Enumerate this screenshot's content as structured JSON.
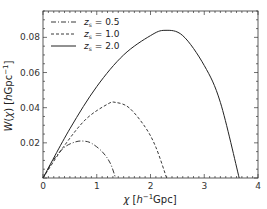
{
  "chart_data": {
    "type": "line",
    "title": "",
    "xlabel": "χ [h⁻¹Gpc]",
    "ylabel": "W(χ) [hGpc⁻¹]",
    "xlim": [
      0,
      4
    ],
    "ylim": [
      0,
      0.095
    ],
    "xticks": [
      0,
      1,
      2,
      3,
      4
    ],
    "xtick_labels": [
      "0",
      "1",
      "2",
      "3",
      "4"
    ],
    "yticks": [
      0.02,
      0.04,
      0.06,
      0.08
    ],
    "ytick_labels": [
      "0.02",
      "0.04",
      "0.06",
      "0.08"
    ],
    "grid": false,
    "legend_position": "upper left",
    "series": [
      {
        "name": "z_s = 0.5",
        "label_main": "z",
        "label_sub": "s",
        "label_val": " = 0.5",
        "style": "dashdot",
        "chi_s": 1.35,
        "x": [
          0,
          0.2,
          0.4,
          0.6,
          0.75,
          0.9,
          1.1,
          1.25,
          1.35
        ],
        "values": [
          0,
          0.0105,
          0.0175,
          0.0205,
          0.021,
          0.0198,
          0.015,
          0.0085,
          0
        ]
      },
      {
        "name": "z_s = 1.0",
        "label_main": "z",
        "label_sub": "s",
        "label_val": " = 1.0",
        "style": "dashed",
        "chi_s": 2.3,
        "x": [
          0,
          0.4,
          0.8,
          1.2,
          1.35,
          1.6,
          1.9,
          2.1,
          2.3
        ],
        "values": [
          0,
          0.0185,
          0.0335,
          0.042,
          0.043,
          0.04,
          0.029,
          0.0175,
          0
        ]
      },
      {
        "name": "z_s = 2.0",
        "label_main": "z",
        "label_sub": "s",
        "label_val": " = 2.0",
        "style": "solid",
        "chi_s": 3.65,
        "x": [
          0,
          0.5,
          1.0,
          1.5,
          2.0,
          2.27,
          2.6,
          3.0,
          3.3,
          3.65
        ],
        "values": [
          0,
          0.028,
          0.052,
          0.07,
          0.081,
          0.084,
          0.081,
          0.064,
          0.043,
          0
        ]
      }
    ]
  }
}
